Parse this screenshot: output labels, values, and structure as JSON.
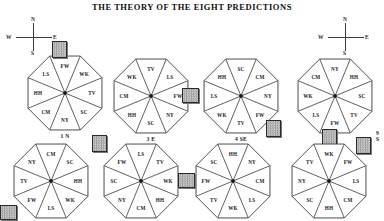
{
  "page": {
    "title": "THE THEORY OF THE EIGHT PREDICTIONS"
  },
  "compass": {
    "north": "N",
    "south": "S",
    "west": "W",
    "east": "E"
  },
  "compasses": [
    {
      "name": "compass-left",
      "north": "N",
      "south": "S",
      "west": "W",
      "east": "E"
    },
    {
      "name": "compass-right",
      "north": "N",
      "south": "S",
      "west": "W",
      "east": "E"
    }
  ],
  "legend": {
    "segment_codes": [
      "FW",
      "WK",
      "TV",
      "SC",
      "NY",
      "CM",
      "HH",
      "LS"
    ]
  },
  "diagrams": [
    {
      "id": "diagram-1",
      "caption": "1 N",
      "caption_position": "below",
      "marker_direction": "N",
      "marker_segment": "FW",
      "segments": [
        "FW",
        "WK",
        "TV",
        "SC",
        "NY",
        "CM",
        "HH",
        "LS"
      ]
    },
    {
      "id": "diagram-2",
      "caption": "3 E",
      "caption_position": "below",
      "marker_direction": "E",
      "marker_segment": "FW",
      "segments": [
        "TV",
        "LS",
        "FW",
        "NY",
        "SC",
        "HH",
        "CM",
        "WK"
      ]
    },
    {
      "id": "diagram-3",
      "caption": "4 SE",
      "caption_position": "below",
      "marker_direction": "SE",
      "marker_segment": "FW",
      "segments": [
        "SC",
        "CM",
        "NY",
        "FW",
        "TV",
        "WK",
        "LS",
        "HH"
      ]
    },
    {
      "id": "diagram-4",
      "caption": "9 S",
      "caption_position": "right",
      "marker_direction": "S",
      "marker_segment": "FW",
      "segments": [
        "NY",
        "HH",
        "SC",
        "TV",
        "FW",
        "LS",
        "WK",
        "CM"
      ]
    },
    {
      "id": "diagram-5",
      "caption": "2 SW",
      "caption_position": "below",
      "marker_direction": "SW",
      "marker_segment": "FW",
      "segments": [
        "CM",
        "SC",
        "HH",
        "WK",
        "LS",
        "FW",
        "TV",
        "NY"
      ]
    },
    {
      "id": "diagram-6",
      "caption": "6 NW",
      "caption_position": "below",
      "marker_direction": "NW",
      "marker_segment": "FW",
      "segments": [
        "LS",
        "TV",
        "WK",
        "HH",
        "CM",
        "NY",
        "SC",
        "FW"
      ]
    },
    {
      "id": "diagram-7",
      "caption": "7 W",
      "caption_position": "below",
      "marker_direction": "W",
      "marker_segment": "FW",
      "segments": [
        "HH",
        "NY",
        "CM",
        "LS",
        "WK",
        "TV",
        "FW",
        "SC"
      ]
    },
    {
      "id": "diagram-8",
      "caption": "8 NE",
      "caption_position": "below",
      "marker_direction": "NE",
      "marker_segment": "FW",
      "segments": [
        "WK",
        "FW",
        "LS",
        "CM",
        "HH",
        "SC",
        "NY",
        "TV"
      ]
    }
  ],
  "colors": {
    "background": "#ffffff",
    "ink": "#1c1c1c",
    "line": "#3a3a3a",
    "marker_fill": "#c6c6c6",
    "marker_border": "#2a2a2a"
  }
}
